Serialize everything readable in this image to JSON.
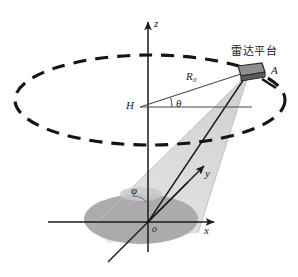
{
  "figure": {
    "title_text": "雷达平台",
    "colors": {
      "stroke": "#1a1a1a",
      "orbit_dash": "#141414",
      "beam_fill": "#d6d6d6",
      "beam_edge": "#bdbdbd",
      "footprint_fill": "#a8a8a8",
      "platform_fill": "#8f8f8f",
      "platform_stroke": "#2b2b2b",
      "background": "#ffffff"
    }
  },
  "labels": {
    "axis_z": "z",
    "axis_x": "x",
    "axis_y": "y",
    "origin": "o",
    "height_H": "H",
    "point_A": "A",
    "range_R": "R",
    "range_R_sub": "0",
    "angle_theta": "θ",
    "angle_phi": "φ",
    "platform_cn": "雷达平台"
  },
  "geometry": {
    "z_axis": {
      "x": 148,
      "y_top": 20,
      "y_bottom": 252
    },
    "x_axis": {
      "y": 222,
      "x_left": 48,
      "x_right": 216
    },
    "y_axis": {
      "x1": 148,
      "y1": 222,
      "x2": 206,
      "y2": 164
    },
    "orbit_ellipse": {
      "cx": 150,
      "cy": 100,
      "rx": 135,
      "ry": 45
    },
    "platform": {
      "x": 248,
      "y": 70
    },
    "H_point": {
      "x": 148,
      "y": 107
    },
    "footprint_ellipse": {
      "cx": 141,
      "cy": 219,
      "rx": 57,
      "ry": 25
    },
    "theta_deg": 13,
    "phi_label_pos": {
      "x": 137,
      "y": 190
    }
  }
}
